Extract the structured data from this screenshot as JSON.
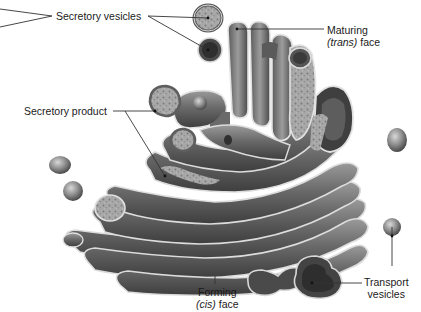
{
  "diagram": {
    "labels": {
      "secretory_vesicles": "Secretory vesicles",
      "maturing_face": {
        "line1": "Maturing",
        "italic": "(trans)",
        "rest": " face"
      },
      "secretory_product": "Secretory product",
      "forming_face": {
        "line1": "Forming",
        "italic": "(cis)",
        "rest": " face"
      },
      "transport_vesicles": {
        "line1": "Transport",
        "line2": "vesicles"
      }
    },
    "colors": {
      "membrane_dark": "#4a4a4a",
      "membrane_mid": "#8a8a8a",
      "membrane_light": "#d6d6d6",
      "content_texture": "#a9a9a9",
      "leader_line": "#333333",
      "background": "#ffffff"
    }
  }
}
